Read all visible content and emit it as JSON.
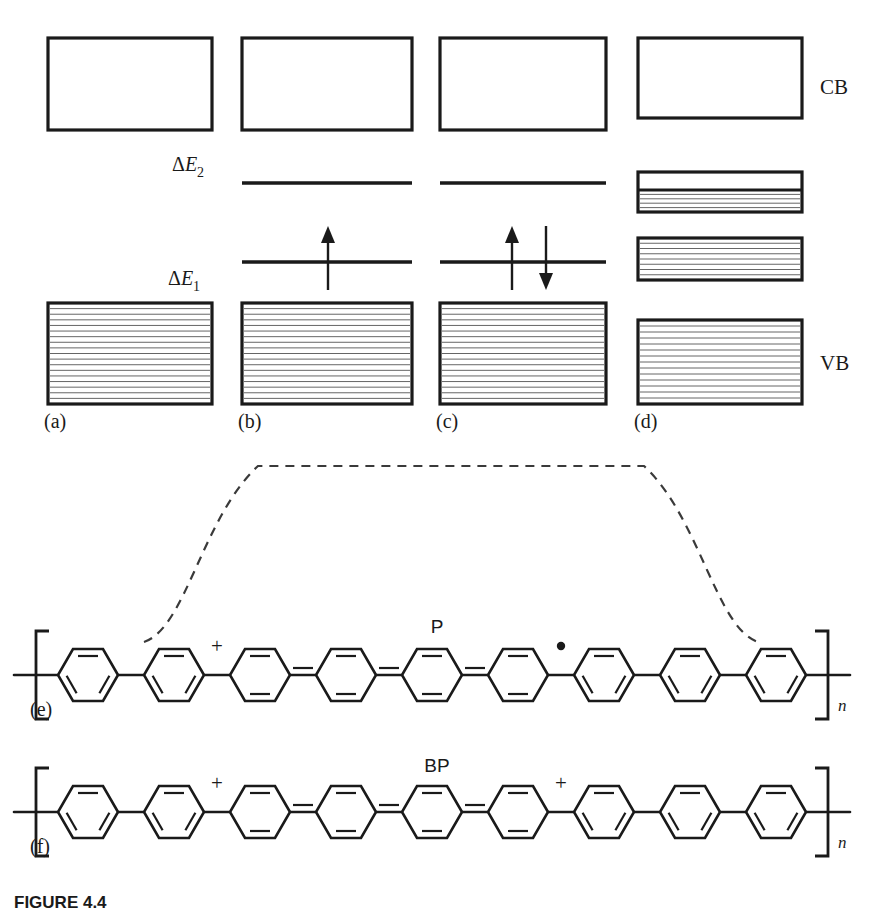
{
  "figure": {
    "caption": "FIGURE 4.4",
    "band_axis_labels": {
      "conduction_band": "CB",
      "valence_band": "VB"
    },
    "gap_labels": {
      "upper": {
        "delta": "Δ",
        "symbol": "E",
        "subscript": "2",
        "full": "ΔE2"
      },
      "lower": {
        "delta": "Δ",
        "symbol": "E",
        "subscript": "1",
        "full": "ΔE1"
      }
    },
    "panels": [
      {
        "id": "a",
        "label": "(a)",
        "description": "neutral polymer: empty conduction band and filled valence band, no gap states",
        "boxes": [
          {
            "name": "conduction-band",
            "x": 48,
            "y": 38,
            "w": 164,
            "h": 92,
            "filled": false,
            "hatch_lines": 0
          },
          {
            "name": "valence-band",
            "x": 48,
            "y": 303,
            "w": 164,
            "h": 101,
            "filled": true,
            "hatch_lines": 17
          }
        ],
        "levels": [],
        "arrows": []
      },
      {
        "id": "b",
        "label": "(b)",
        "description": "polaron: two mid-gap levels, lower level singly occupied by one unpaired electron",
        "boxes": [
          {
            "name": "conduction-band",
            "x": 242,
            "y": 38,
            "w": 170,
            "h": 92,
            "filled": false,
            "hatch_lines": 0
          },
          {
            "name": "valence-band",
            "x": 242,
            "y": 303,
            "w": 170,
            "h": 101,
            "filled": true,
            "hatch_lines": 17
          }
        ],
        "levels": [
          {
            "name": "upper-gap-level",
            "x1": 242,
            "x2": 412,
            "y": 183
          },
          {
            "name": "lower-gap-level",
            "x1": 242,
            "x2": 412,
            "y": 262
          }
        ],
        "arrows": [
          {
            "name": "spin-up-arrow",
            "x": 328,
            "direction": "up",
            "y_top": 226,
            "y_bottom": 290
          }
        ]
      },
      {
        "id": "c",
        "label": "(c)",
        "description": "bipolaron-like state: lower gap level doubly occupied with paired spins",
        "boxes": [
          {
            "name": "conduction-band",
            "x": 440,
            "y": 38,
            "w": 166,
            "h": 92,
            "filled": false,
            "hatch_lines": 0
          },
          {
            "name": "valence-band",
            "x": 440,
            "y": 303,
            "w": 166,
            "h": 101,
            "filled": true,
            "hatch_lines": 17
          }
        ],
        "levels": [
          {
            "name": "upper-gap-level",
            "x1": 440,
            "x2": 606,
            "y": 183
          },
          {
            "name": "lower-gap-level",
            "x1": 440,
            "x2": 606,
            "y": 262
          }
        ],
        "arrows": [
          {
            "name": "spin-up-arrow",
            "x": 512,
            "direction": "up",
            "y_top": 226,
            "y_bottom": 290
          },
          {
            "name": "spin-down-arrow",
            "x": 546,
            "direction": "down",
            "y_top": 226,
            "y_bottom": 290
          }
        ]
      },
      {
        "id": "d",
        "label": "(d)",
        "description": "heavily doped polymer: gap states broadened into partially filled bipolaron bands",
        "boxes": [
          {
            "name": "conduction-band",
            "x": 638,
            "y": 38,
            "w": 164,
            "h": 80,
            "filled": false,
            "hatch_lines": 0
          },
          {
            "name": "upper-bipolaron-band",
            "x": 638,
            "y": 172,
            "w": 164,
            "h": 40,
            "filled": "partial",
            "hatch_lines": 4,
            "split_fraction": 0.45
          },
          {
            "name": "lower-bipolaron-band",
            "x": 638,
            "y": 238,
            "w": 164,
            "h": 42,
            "filled": true,
            "hatch_lines": 7
          },
          {
            "name": "valence-band",
            "x": 638,
            "y": 320,
            "w": 164,
            "h": 84,
            "filled": true,
            "hatch_lines": 13
          }
        ],
        "levels": [],
        "arrows": []
      }
    ],
    "chains": [
      {
        "id": "e",
        "label": "(e)",
        "species": "P",
        "species_meaning": "polaron",
        "repeat_unit": "n",
        "rings": 9,
        "markers": [
          {
            "name": "positive-charge",
            "symbol": "+",
            "after_ring": 2
          },
          {
            "name": "radical-dot",
            "symbol": "•",
            "after_ring": 6
          }
        ],
        "quinoid_span": [
          3,
          4,
          5,
          6
        ],
        "y_center": 675
      },
      {
        "id": "f",
        "label": "(f)",
        "species": "BP",
        "species_meaning": "bipolaron",
        "repeat_unit": "n",
        "rings": 9,
        "markers": [
          {
            "name": "positive-charge-left",
            "symbol": "+",
            "after_ring": 2
          },
          {
            "name": "positive-charge-right",
            "symbol": "+",
            "after_ring": 6
          }
        ],
        "quinoid_span": [
          3,
          4,
          5,
          6
        ],
        "y_center": 812
      }
    ],
    "envelope": {
      "name": "defect-envelope",
      "description": "dashed trapezoidal envelope marking the polaron defect region on the chain",
      "start_x": 180,
      "end_x": 722,
      "baseline_y": 632,
      "plateau_y": 466
    },
    "colors": {
      "ink": "#1a1a1a",
      "hatch": "#555555",
      "dash": "#3a3a3a",
      "background": "#ffffff"
    }
  }
}
